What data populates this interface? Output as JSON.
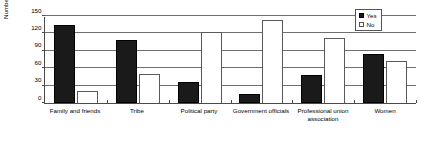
{
  "chart_data": {
    "type": "bar",
    "title": "",
    "xlabel": "",
    "ylabel": "Number of Candidates",
    "ylim": [
      0,
      150
    ],
    "yticks": [
      0,
      30,
      60,
      90,
      120,
      150
    ],
    "grid": true,
    "legend_position": "top-right",
    "categories": [
      "Family and friends",
      "Tribe",
      "Political party",
      "Government officials",
      "Professional union association",
      "Women"
    ],
    "series": [
      {
        "name": "Yes",
        "color": "#1a1a1a",
        "values": [
          135,
          108,
          37,
          15,
          48,
          84
        ]
      },
      {
        "name": "No",
        "color": "#ffffff",
        "values": [
          20,
          50,
          122,
          143,
          112,
          72
        ]
      }
    ]
  },
  "legend": {
    "items": [
      {
        "label": "Yes"
      },
      {
        "label": "No"
      }
    ]
  }
}
